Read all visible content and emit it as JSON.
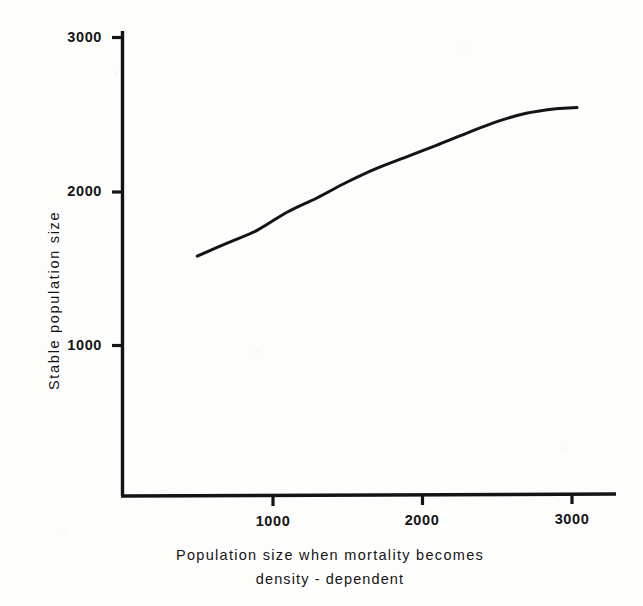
{
  "figure": {
    "background_color": "#fdfdfc",
    "ink_color": "#141414"
  },
  "chart_data": {
    "type": "line",
    "title": "",
    "subtitle": "",
    "xlabel_line1": "Population size when mortality becomes",
    "xlabel_line2": "density - dependent",
    "xlabel": "Population size when mortality becomes density - dependent",
    "ylabel": "Stable population size",
    "xlim": [
      0,
      3300
    ],
    "ylim": [
      0,
      3000
    ],
    "xticks": [
      1000,
      2000,
      3000
    ],
    "xtick_labels": [
      "1000",
      "2000",
      "3000"
    ],
    "yticks": [
      1000,
      2000,
      3000
    ],
    "ytick_labels": [
      "1000",
      "2000",
      "3000"
    ],
    "grid": false,
    "legend": null,
    "legend_position": "none",
    "annotations": [],
    "series": [
      {
        "name": "Stable population size",
        "color": "#141414",
        "line_width": 3,
        "x": [
          500,
          700,
          900,
          1100,
          1300,
          1500,
          1700,
          1900,
          2100,
          2300,
          2500,
          2700,
          2900,
          3040
        ],
        "y": [
          1580,
          1665,
          1748,
          1865,
          1958,
          2060,
          2150,
          2225,
          2300,
          2378,
          2452,
          2508,
          2538,
          2545
        ]
      }
    ]
  },
  "axes": {
    "x_tick_values": [
      "1000",
      "2000",
      "3000"
    ],
    "y_tick_values": [
      "3000",
      "2000",
      "1000"
    ]
  }
}
